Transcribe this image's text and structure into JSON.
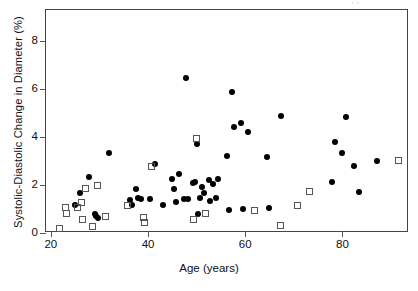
{
  "chart_data": {
    "type": "scatter",
    "title": "",
    "xlabel": "Age (years)",
    "ylabel": "Systolic-Diastolic Change in Diameter (%)",
    "xlim": [
      19.0,
      93.7
    ],
    "ylim": [
      0.0,
      9.3
    ],
    "xticks": [
      20,
      40,
      60,
      80
    ],
    "yticks": [
      0,
      2,
      4,
      6,
      8
    ],
    "grid": false,
    "legend": "none",
    "series": [
      {
        "name": "filled-circles",
        "marker": "filled circle",
        "color": "#000000",
        "points": [
          [
            25.0,
            1.15
          ],
          [
            26.0,
            1.68
          ],
          [
            27.8,
            2.35
          ],
          [
            29.0,
            0.78
          ],
          [
            29.3,
            0.7
          ],
          [
            29.6,
            0.62
          ],
          [
            32.0,
            3.33
          ],
          [
            36.2,
            1.36
          ],
          [
            36.6,
            1.15
          ],
          [
            37.5,
            1.82
          ],
          [
            38.0,
            1.45
          ],
          [
            38.6,
            1.4
          ],
          [
            40.4,
            1.4
          ],
          [
            41.5,
            2.87
          ],
          [
            43.0,
            1.15
          ],
          [
            45.0,
            2.26
          ],
          [
            45.3,
            1.83
          ],
          [
            45.8,
            1.3
          ],
          [
            46.4,
            2.47
          ],
          [
            47.3,
            1.4
          ],
          [
            47.8,
            6.47
          ],
          [
            48.3,
            1.43
          ],
          [
            49.2,
            2.08
          ],
          [
            49.6,
            2.13
          ],
          [
            50.0,
            3.73
          ],
          [
            50.2,
            0.78
          ],
          [
            50.6,
            1.47
          ],
          [
            51.2,
            1.92
          ],
          [
            51.6,
            1.68
          ],
          [
            52.6,
            2.22
          ],
          [
            52.8,
            1.32
          ],
          [
            53.4,
            2.03
          ],
          [
            54.0,
            1.47
          ],
          [
            54.4,
            2.25
          ],
          [
            56.2,
            3.23
          ],
          [
            56.6,
            0.98
          ],
          [
            57.3,
            5.9
          ],
          [
            57.6,
            4.4
          ],
          [
            59.2,
            4.6
          ],
          [
            59.6,
            1.02
          ],
          [
            60.6,
            4.22
          ],
          [
            64.4,
            3.17
          ],
          [
            64.8,
            1.06
          ],
          [
            67.3,
            4.9
          ],
          [
            77.8,
            2.13
          ],
          [
            78.4,
            3.78
          ],
          [
            80.0,
            3.33
          ],
          [
            80.8,
            4.83
          ],
          [
            82.4,
            2.78
          ],
          [
            83.4,
            1.7
          ],
          [
            87.2,
            3.02
          ]
        ]
      },
      {
        "name": "open-squares",
        "marker": "open square",
        "color": "#555555",
        "points": [
          [
            21.8,
            0.2
          ],
          [
            23.0,
            1.05
          ],
          [
            23.2,
            0.8
          ],
          [
            25.4,
            1.08
          ],
          [
            26.4,
            1.28
          ],
          [
            26.6,
            0.57
          ],
          [
            27.2,
            1.85
          ],
          [
            28.6,
            0.28
          ],
          [
            29.5,
            2.0
          ],
          [
            31.2,
            0.68
          ],
          [
            35.8,
            1.13
          ],
          [
            39.0,
            0.65
          ],
          [
            39.2,
            0.45
          ],
          [
            40.8,
            2.77
          ],
          [
            49.4,
            0.58
          ],
          [
            50.0,
            3.95
          ],
          [
            51.8,
            0.8
          ],
          [
            62.0,
            0.92
          ],
          [
            67.2,
            0.3
          ],
          [
            70.8,
            1.13
          ],
          [
            73.2,
            1.75
          ],
          [
            91.6,
            3.02
          ]
        ]
      }
    ]
  },
  "axes": {
    "xlabel": "Age (years)",
    "ylabel": "Systolic-Diastolic Change in Diameter (%)",
    "xtick_labels": [
      "20",
      "40",
      "60",
      "80"
    ],
    "ytick_labels": [
      "0",
      "2",
      "4",
      "6",
      "8"
    ]
  },
  "stray_mark": "' '"
}
